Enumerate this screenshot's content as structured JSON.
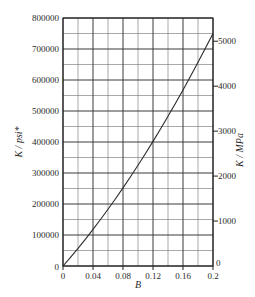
{
  "chart_data": {
    "type": "line",
    "title": "",
    "xlabel": "B",
    "ylabel": "K / psi*",
    "ylabel_right": "K / MPa",
    "xlim": [
      0,
      0.2
    ],
    "ylim": [
      0,
      800000
    ],
    "ylim_right": [
      0,
      5516
    ],
    "grid": true,
    "legend": "none",
    "x_ticks": [
      0,
      0.04,
      0.08,
      0.12,
      0.16,
      0.2
    ],
    "x_tick_labels": [
      "0",
      "0.04",
      "0.08",
      "0.12",
      "0.16",
      "0.2"
    ],
    "y_ticks": [
      0,
      100000,
      200000,
      300000,
      400000,
      500000,
      600000,
      700000,
      800000
    ],
    "y_tick_labels": [
      "0",
      "100000",
      "200000",
      "300000",
      "400000",
      "500000",
      "600000",
      "700000",
      "800000"
    ],
    "y_right_ticks": [
      0,
      1000,
      2000,
      3000,
      4000,
      5000
    ],
    "y_right_tick_labels": [
      "0",
      "1000",
      "2000",
      "3000",
      "4000",
      "5000"
    ],
    "x_minor_step": 0.02,
    "y_minor_step": 50000,
    "origin_label_left": "0",
    "origin_label_right": "0",
    "series": [
      {
        "name": "K vs B",
        "x": [
          0.0,
          0.01,
          0.02,
          0.03,
          0.04,
          0.05,
          0.06,
          0.07,
          0.08,
          0.09,
          0.1,
          0.11,
          0.12,
          0.13,
          0.14,
          0.15,
          0.16,
          0.17,
          0.18,
          0.19,
          0.2
        ],
        "y": [
          0,
          28000,
          57000,
          87000,
          118000,
          150000,
          183000,
          217000,
          252000,
          288000,
          325000,
          363000,
          402000,
          442000,
          483000,
          525000,
          568000,
          612000,
          657000,
          703000,
          750000
        ]
      }
    ]
  },
  "axes": {
    "left_label": "K / psi*",
    "right_label": "K / MPa",
    "bottom_label": "B"
  }
}
